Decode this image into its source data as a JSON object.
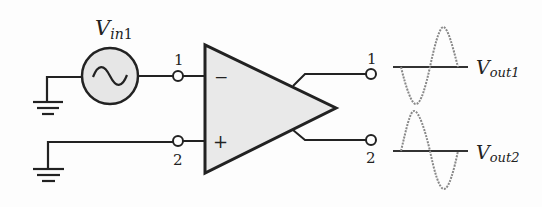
{
  "diagram": {
    "source": {
      "label_main": "V",
      "label_sub": "in",
      "label_num": "1",
      "symbol": "ac-sine-source-icon"
    },
    "inputs": {
      "terminal_1": "1",
      "terminal_2": "2",
      "minus_sign": "−",
      "plus_sign": "+"
    },
    "outputs": {
      "terminal_1": "1",
      "terminal_2": "2",
      "vout1": {
        "main": "V",
        "sub": "out1"
      },
      "vout2": {
        "main": "V",
        "sub": "out2"
      }
    },
    "colors": {
      "stroke": "#222222",
      "amp_fill": "#e9e9e9",
      "source_fill": "#e6e6e6",
      "waveform": "#888888"
    }
  }
}
